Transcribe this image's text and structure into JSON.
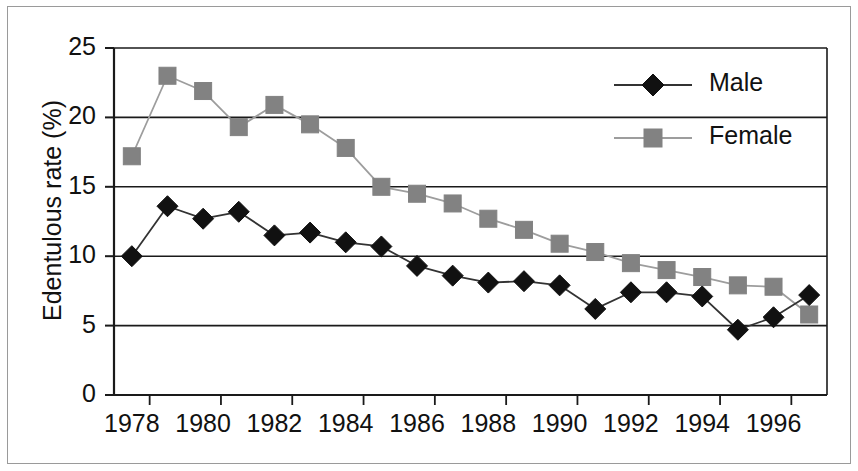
{
  "chart_data": {
    "type": "line",
    "title": "",
    "xlabel": "",
    "ylabel": "Edentulous rate (%)",
    "x": [
      1978,
      1979,
      1980,
      1981,
      1982,
      1983,
      1984,
      1985,
      1986,
      1987,
      1988,
      1989,
      1990,
      1991,
      1992,
      1993,
      1994,
      1995,
      1996,
      1997
    ],
    "xlim": [
      1977.5,
      1997.5
    ],
    "ylim": [
      0,
      25
    ],
    "yticks": [
      0,
      5,
      10,
      15,
      20,
      25
    ],
    "ytick_labels": [
      "0",
      "5",
      "10",
      "15",
      "20",
      "25"
    ],
    "xtick_labels": [
      "1978",
      "1980",
      "1982",
      "1984",
      "1986",
      "1988",
      "1990",
      "1992",
      "1994",
      "1996"
    ],
    "xtick_values": [
      1978,
      1980,
      1982,
      1984,
      1986,
      1988,
      1990,
      1992,
      1994,
      1996
    ],
    "grid": "horizontal",
    "legend_position": "upper right",
    "series": [
      {
        "name": "Male",
        "marker": "diamond",
        "color": "#111111",
        "line_color": "#333333",
        "values": [
          10.0,
          13.6,
          12.7,
          13.2,
          11.5,
          11.7,
          11.0,
          10.7,
          9.3,
          8.6,
          8.1,
          8.2,
          7.9,
          6.2,
          7.4,
          7.4,
          7.1,
          4.7,
          5.6,
          7.2
        ]
      },
      {
        "name": "Female",
        "marker": "square",
        "color": "#828282",
        "line_color": "#9d9d9d",
        "values": [
          17.2,
          23.0,
          21.9,
          19.3,
          20.9,
          19.5,
          17.8,
          15.0,
          14.5,
          13.8,
          12.7,
          11.9,
          10.9,
          10.3,
          9.5,
          9.0,
          8.5,
          7.9,
          7.8,
          5.8
        ]
      }
    ]
  },
  "legend": {
    "items": [
      {
        "label": "Male",
        "marker": "diamond",
        "color": "#111111"
      },
      {
        "label": "Female",
        "marker": "square",
        "color": "#828282"
      }
    ]
  }
}
